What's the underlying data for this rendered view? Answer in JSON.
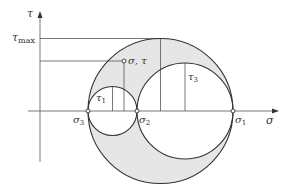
{
  "diagram": {
    "axes": {
      "x_label": "σ",
      "y_label": "τ"
    },
    "labels": {
      "tau_max_main": "τ",
      "tau_max_sub": "max",
      "point": "σ, τ",
      "tau1_main": "τ",
      "tau1_sub": "1",
      "tau3_main": "τ",
      "tau3_sub": "3",
      "sigma3_main": "σ",
      "sigma3_sub": "3",
      "sigma2_main": "σ",
      "sigma2_sub": "2",
      "sigma1_main": "σ",
      "sigma1_sub": "1"
    },
    "colors": {
      "stroke": "#333333",
      "thin_line": "#555555",
      "shade": "#e6e6e6",
      "background": "#ffffff"
    },
    "circles": [
      {
        "name": "outer",
        "from": "σ3",
        "to": "σ1"
      },
      {
        "name": "small",
        "from": "σ3",
        "to": "σ2"
      },
      {
        "name": "right",
        "from": "σ2",
        "to": "σ1"
      }
    ]
  }
}
